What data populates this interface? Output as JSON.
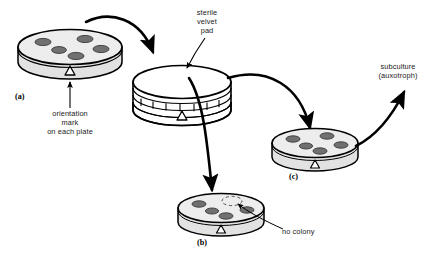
{
  "figure": {
    "background": "#ffffff",
    "ink": "#000000",
    "plate_top_fill": "#ededed",
    "plate_side_fill": "#e2e2e2",
    "colony_fill": "#707070",
    "colony_stroke": "#3a3a3a"
  },
  "labels": {
    "sterile_velvet_pad": "sterile\nvelvet\npad",
    "orientation_mark": "orientation\nmark\non each plate",
    "subculture": "subculture\n(auxotroph)",
    "no_colony": "no colony"
  },
  "panels": {
    "a": "(a)",
    "b": "(b)",
    "c": "(c)"
  },
  "plates": [
    {
      "id": "master-plate",
      "panel": "(a)",
      "colony_count": 5,
      "empty_colony_count": 0,
      "orientation_mark": "triangle"
    },
    {
      "id": "velvet-pad-block",
      "panel": "",
      "colony_count": 0,
      "empty_colony_count": 0,
      "orientation_mark": "triangle"
    },
    {
      "id": "replica-plate-b",
      "panel": "(b)",
      "colony_count": 4,
      "empty_colony_count": 1,
      "orientation_mark": "triangle"
    },
    {
      "id": "replica-plate-c",
      "panel": "(c)",
      "colony_count": 5,
      "empty_colony_count": 0,
      "orientation_mark": "triangle"
    }
  ],
  "arrows": [
    {
      "id": "arrow-a-to-pad",
      "from": "master-plate",
      "to": "velvet-pad-block"
    },
    {
      "id": "arrow-pad-to-b",
      "from": "velvet-pad-block",
      "to": "replica-plate-b"
    },
    {
      "id": "arrow-pad-to-c",
      "from": "velvet-pad-block",
      "to": "replica-plate-c"
    },
    {
      "id": "arrow-c-to-subculture",
      "from": "replica-plate-c",
      "to": "subculture"
    }
  ],
  "leaders": [
    {
      "id": "leader-velvet-pad",
      "label": "sterile velvet pad"
    },
    {
      "id": "leader-orientation-mark",
      "label": "orientation mark on each plate"
    },
    {
      "id": "leader-no-colony",
      "label": "no colony"
    }
  ]
}
